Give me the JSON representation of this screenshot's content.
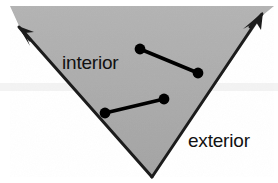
{
  "figure": {
    "canvas": {
      "width": 278,
      "height": 183,
      "background": "#ffffff"
    },
    "labels": {
      "interior": "interior",
      "exterior": "exterior"
    },
    "colors": {
      "region_fill": "#a9a9a9",
      "region_fill_light": "#b4b4b4",
      "edge_stroke": "#1c1c1c",
      "segment_stroke": "#000000",
      "dot_fill": "#000000",
      "label_color": "#111111",
      "background": "#ffffff",
      "scan_band": "#f2f2f2"
    },
    "region": {
      "name": "shaded-wedge",
      "vertices": [
        {
          "name": "apex-bottom",
          "x": 152,
          "y": 177
        },
        {
          "name": "ray-end-upper-left",
          "x": 19,
          "y": 27
        },
        {
          "name": "ray-end-upper-right",
          "x": 262,
          "y": 14
        }
      ],
      "fill_path": "M 152 177 L 19 27 L 12 8 L 272 8 L 262 14 Z"
    },
    "edges": [
      {
        "name": "left-edge-ray",
        "x1": 152,
        "y1": 177,
        "x2": 22,
        "y2": 30,
        "arrow": "at-end"
      },
      {
        "name": "right-edge-ray",
        "x1": 152,
        "y1": 177,
        "x2": 259,
        "y2": 17,
        "arrow": "at-end"
      }
    ],
    "arrowheads": [
      {
        "name": "arrowhead-upper-left",
        "tip_x": 19,
        "tip_y": 27,
        "angle_deg": 228
      },
      {
        "name": "arrowhead-upper-right",
        "tip_x": 262,
        "tip_y": 14,
        "angle_deg": 304
      }
    ],
    "segments": [
      {
        "name": "interior-chord-upper",
        "x1": 140,
        "y1": 49,
        "x2": 198,
        "y2": 73,
        "dot_radius": 5.4,
        "stroke_width": 3.6
      },
      {
        "name": "interior-chord-lower",
        "x1": 105,
        "y1": 113,
        "x2": 164,
        "y2": 99,
        "dot_radius": 5.4,
        "stroke_width": 3.6
      }
    ],
    "label_positions": {
      "interior": {
        "x": 62,
        "y": 69,
        "font_size": 19
      },
      "exterior": {
        "x": 188,
        "y": 147,
        "font_size": 19
      }
    },
    "scan_band": {
      "x": 0,
      "y": 83,
      "width": 278,
      "height": 8
    }
  }
}
